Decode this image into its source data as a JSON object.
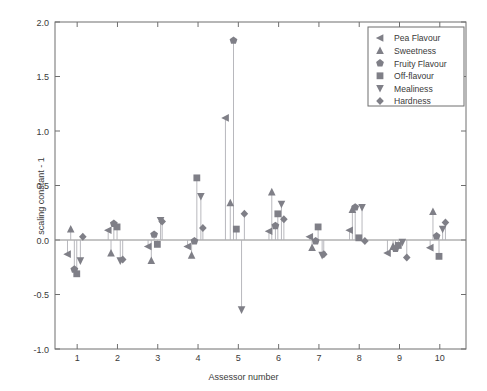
{
  "chart_data": {
    "type": "scatter",
    "title": "",
    "xlabel": "Assessor number",
    "ylabel": "scaling constant - 1",
    "xlim": [
      0.45,
      10.65
    ],
    "ylim": [
      -1.0,
      2.0
    ],
    "yticks": [
      "2.0",
      "1.5",
      "1.0",
      "0.5",
      "0.0",
      "-0.5",
      "-1.0"
    ],
    "ytick_values": [
      2.0,
      1.5,
      1.0,
      0.5,
      0.0,
      -0.5,
      -1.0
    ],
    "xticks": [
      "1",
      "2",
      "3",
      "4",
      "5",
      "6",
      "7",
      "8",
      "9",
      "10"
    ],
    "xtick_values": [
      1,
      2,
      3,
      4,
      5,
      6,
      7,
      8,
      9,
      10
    ],
    "grid": false,
    "zero_reference_line": 0.0,
    "stems": true,
    "marker_color": "#7f7f87",
    "stem_color": "#b0b0b6",
    "legend_position": "top-right",
    "legend": [
      {
        "name": "Pea Flavour",
        "marker": "triangle-left"
      },
      {
        "name": "Sweetness",
        "marker": "triangle-up"
      },
      {
        "name": "Fruity Flavour",
        "marker": "pentagon"
      },
      {
        "name": "Off-flavour",
        "marker": "square"
      },
      {
        "name": "Mealiness",
        "marker": "triangle-down"
      },
      {
        "name": "Hardness",
        "marker": "diamond"
      }
    ],
    "series": [
      {
        "name": "Pea Flavour",
        "marker": "triangle-left",
        "points": [
          [
            0.76,
            -0.13
          ],
          [
            1.77,
            0.09
          ],
          [
            2.76,
            -0.06
          ],
          [
            3.74,
            -0.06
          ],
          [
            4.68,
            1.12
          ],
          [
            5.76,
            0.08
          ],
          [
            6.77,
            0.03
          ],
          [
            7.76,
            0.09
          ],
          [
            8.7,
            -0.12
          ],
          [
            9.76,
            -0.07
          ]
        ]
      },
      {
        "name": "Sweetness",
        "marker": "triangle-up",
        "points": [
          [
            0.84,
            0.1
          ],
          [
            1.84,
            -0.12
          ],
          [
            2.84,
            -0.19
          ],
          [
            3.84,
            -0.14
          ],
          [
            4.8,
            0.34
          ],
          [
            5.83,
            0.44
          ],
          [
            6.83,
            -0.07
          ],
          [
            7.83,
            0.28
          ],
          [
            8.84,
            -0.06
          ],
          [
            9.83,
            0.26
          ]
        ]
      },
      {
        "name": "Fruity Flavour",
        "marker": "pentagon",
        "points": [
          [
            0.93,
            -0.27
          ],
          [
            1.91,
            0.15
          ],
          [
            2.91,
            0.05
          ],
          [
            3.91,
            -0.01
          ],
          [
            4.88,
            1.83
          ],
          [
            5.92,
            0.13
          ],
          [
            6.92,
            -0.01
          ],
          [
            7.9,
            0.3
          ],
          [
            8.9,
            -0.08
          ],
          [
            9.92,
            0.035
          ]
        ]
      },
      {
        "name": "Off-flavour",
        "marker": "square",
        "points": [
          [
            0.99,
            -0.31
          ],
          [
            1.99,
            0.12
          ],
          [
            2.99,
            -0.04
          ],
          [
            3.97,
            0.57
          ],
          [
            4.95,
            0.1
          ],
          [
            5.98,
            0.24
          ],
          [
            6.98,
            0.12
          ],
          [
            7.99,
            0.02
          ],
          [
            8.97,
            -0.05
          ],
          [
            9.98,
            -0.15
          ]
        ]
      },
      {
        "name": "Mealiness",
        "marker": "triangle-down",
        "points": [
          [
            1.08,
            -0.19
          ],
          [
            2.07,
            -0.19
          ],
          [
            3.07,
            0.18
          ],
          [
            4.07,
            0.4
          ],
          [
            5.08,
            -0.64
          ],
          [
            6.07,
            0.33
          ],
          [
            7.08,
            -0.14
          ],
          [
            8.07,
            0.3
          ],
          [
            9.07,
            -0.02
          ],
          [
            10.07,
            0.1
          ]
        ]
      },
      {
        "name": "Hardness",
        "marker": "diamond",
        "points": [
          [
            1.14,
            0.03
          ],
          [
            2.13,
            -0.18
          ],
          [
            3.11,
            0.17
          ],
          [
            4.12,
            0.11
          ],
          [
            5.15,
            0.24
          ],
          [
            6.13,
            0.19
          ],
          [
            7.12,
            -0.13
          ],
          [
            8.14,
            -0.01
          ],
          [
            9.18,
            -0.16
          ],
          [
            10.14,
            0.16
          ]
        ]
      }
    ]
  }
}
